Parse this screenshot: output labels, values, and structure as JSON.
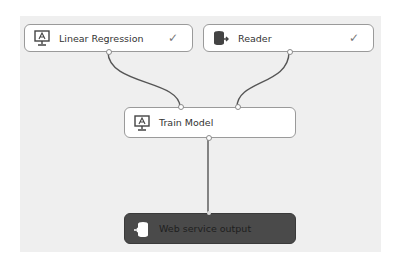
{
  "canvas": {
    "background": "#efefef"
  },
  "nodes": [
    {
      "id": "linear-regression",
      "label": "Linear Regression",
      "icon": "model-icon",
      "status": "✓"
    },
    {
      "id": "reader",
      "label": "Reader",
      "icon": "database-reader-icon",
      "status": "✓"
    },
    {
      "id": "train-model",
      "label": "Train Model",
      "icon": "model-icon",
      "status": ""
    },
    {
      "id": "web-service-output",
      "label": "Web service output",
      "icon": "web-service-output-icon",
      "status": ""
    }
  ],
  "connections": [
    {
      "from": "linear-regression",
      "to": "train-model"
    },
    {
      "from": "reader",
      "to": "train-model"
    },
    {
      "from": "train-model",
      "to": "web-service-output"
    }
  ],
  "colors": {
    "node_bg": "#ffffff",
    "node_border": "#9a9a9a",
    "output_node_bg": "#4a4a4a",
    "edge": "#555555"
  }
}
